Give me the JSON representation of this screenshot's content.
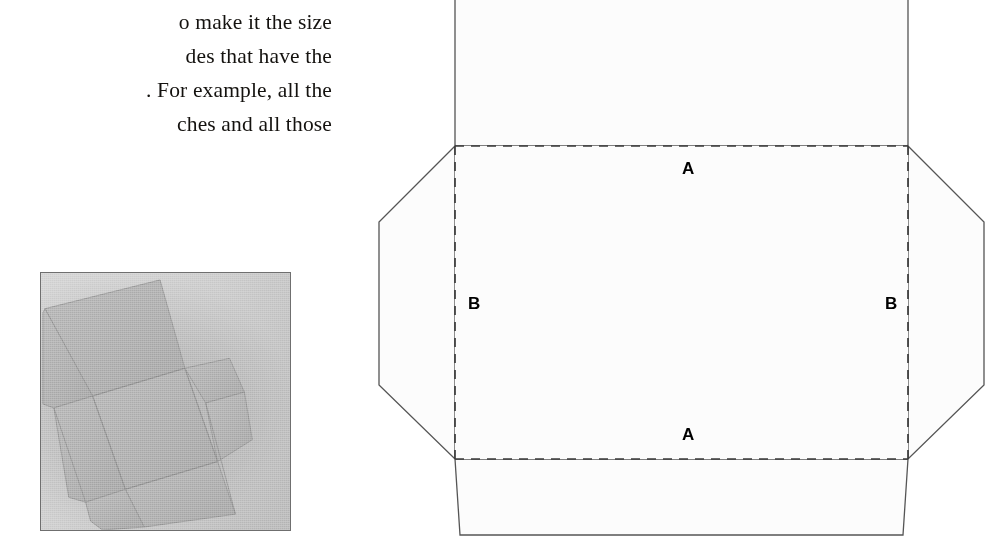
{
  "page": {
    "background_color": "#ffffff",
    "width": 986,
    "height": 557
  },
  "body_text": {
    "lines": [
      "g",
      "o make it the size",
      "des that have the",
      ". For example, all the",
      "ches and all those"
    ]
  },
  "photo": {
    "caption": "",
    "alt_name": "photograph-of-flat-box-template",
    "border_color": "#6f6f6f",
    "background_color": "#c9c9c9",
    "card_color": "#adadad"
  },
  "diagram": {
    "name": "box-die-cut-template",
    "line_color": "#555555",
    "fill_color": "#fcfcfc",
    "dashed_color": "#3a3a3a",
    "labels": [
      {
        "id": "a-top",
        "text": "A"
      },
      {
        "id": "a-bottom",
        "text": "A"
      },
      {
        "id": "b-left",
        "text": "B"
      },
      {
        "id": "b-right",
        "text": "B"
      }
    ]
  }
}
